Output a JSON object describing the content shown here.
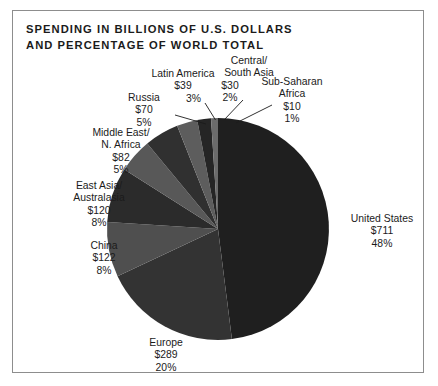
{
  "title": {
    "line1": "SPENDING IN BILLIONS OF U.S. DOLLARS",
    "line2": "AND PERCENTAGE OF WORLD TOTAL"
  },
  "chart_data": {
    "type": "pie",
    "title": "SPENDING IN BILLIONS OF U.S. DOLLARS AND PERCENTAGE OF WORLD TOTAL",
    "xlabel": "",
    "ylabel": "",
    "value_unit": "billions of U.S. dollars",
    "legend_position": "none",
    "grid": false,
    "start_angle_deg": 0,
    "direction": "clockwise",
    "categories": [
      "United States",
      "Europe",
      "China",
      "East Asia/ Australasia",
      "Middle East/ N. Africa",
      "Russia",
      "Latin America",
      "Central/ South Asia",
      "Sub-Saharan Africa"
    ],
    "values": [
      711,
      289,
      122,
      120,
      82,
      70,
      39,
      30,
      10
    ],
    "percentages": [
      48,
      20,
      8,
      8,
      5,
      5,
      3,
      2,
      1
    ],
    "colors": [
      "#1f1f1f",
      "#333333",
      "#4f4f4f",
      "#2b2b2b",
      "#585858",
      "#303030",
      "#5d5d5d",
      "#252525",
      "#6b6b6b"
    ],
    "slices": [
      {
        "label": "United States",
        "value_text": "$711",
        "pct_text": "48%",
        "value": 711,
        "pct": 48,
        "color": "#1f1f1f"
      },
      {
        "label": "Europe",
        "value_text": "$289",
        "pct_text": "20%",
        "value": 289,
        "pct": 20,
        "color": "#333333"
      },
      {
        "label": "China",
        "value_text": "$122",
        "pct_text": "8%",
        "value": 122,
        "pct": 8,
        "color": "#4f4f4f"
      },
      {
        "label": "East Asia/ Australasia",
        "value_text": "$120",
        "pct_text": "8%",
        "value": 120,
        "pct": 8,
        "color": "#2b2b2b"
      },
      {
        "label": "Middle East/ N. Africa",
        "value_text": "$82",
        "pct_text": "5%",
        "value": 82,
        "pct": 5,
        "color": "#585858"
      },
      {
        "label": "Russia",
        "value_text": "$70",
        "pct_text": "5%",
        "value": 70,
        "pct": 5,
        "color": "#303030"
      },
      {
        "label": "Latin America",
        "value_text": "$39",
        "pct_text": "3%",
        "value": 39,
        "pct": 3,
        "color": "#5d5d5d"
      },
      {
        "label": "Central/ South Asia",
        "value_text": "$30",
        "pct_text": "2%",
        "value": 30,
        "pct": 2,
        "color": "#252525"
      },
      {
        "label": "Sub-Saharan Africa",
        "value_text": "$10",
        "pct_text": "1%",
        "value": 10,
        "pct": 1,
        "color": "#6b6b6b"
      }
    ]
  },
  "labels": {
    "united_states": {
      "l1": "United States",
      "l2": "$711",
      "l3": "48%"
    },
    "europe": {
      "l1": "Europe",
      "l2": "$289",
      "l3": "20%"
    },
    "china": {
      "l1": "China",
      "l2": "$122",
      "l3": "8%"
    },
    "east_asia": {
      "l1": "East Asia/",
      "l2": "Australasia",
      "l3": "$120",
      "l4": "8%"
    },
    "middle_east": {
      "l1": "Middle East/",
      "l2": "N. Africa",
      "l3": "$82",
      "l4": "5%"
    },
    "russia": {
      "l1": "Russia",
      "l2": "$70",
      "l3": "5%"
    },
    "latin_america": {
      "l1": "Latin America",
      "l2": "$39",
      "l3": "3%"
    },
    "central_south_asia": {
      "l1": "Central/",
      "l2": "South Asia",
      "l3": "$30",
      "l4": "2%"
    },
    "sub_saharan": {
      "l1": "Sub-Saharan",
      "l2": "Africa",
      "l3": "$10",
      "l4": "1%"
    }
  }
}
